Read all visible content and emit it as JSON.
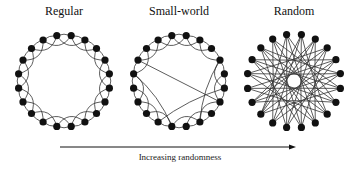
{
  "panels": [
    {
      "id": "regular",
      "title": "Regular",
      "cx": 64,
      "cy": 81,
      "r": 46,
      "nodes": 20,
      "rewired": []
    },
    {
      "id": "small-world",
      "title": "Small-world",
      "cx": 179,
      "cy": 81,
      "r": 46,
      "nodes": 20,
      "rewired": [
        [
          3,
          8
        ],
        [
          15,
          10
        ],
        [
          16,
          6
        ],
        [
          11,
          5
        ]
      ]
    },
    {
      "id": "random",
      "title": "Random",
      "cx": 294,
      "cy": 81,
      "r": 47,
      "nodes": 20,
      "random_edges": [
        [
          0,
          9
        ],
        [
          0,
          12
        ],
        [
          1,
          10
        ],
        [
          1,
          13
        ],
        [
          2,
          11
        ],
        [
          2,
          15
        ],
        [
          3,
          12
        ],
        [
          3,
          16
        ],
        [
          4,
          13
        ],
        [
          4,
          17
        ],
        [
          5,
          14
        ],
        [
          5,
          18
        ],
        [
          6,
          15
        ],
        [
          6,
          19
        ],
        [
          7,
          16
        ],
        [
          7,
          0
        ],
        [
          8,
          17
        ],
        [
          8,
          1
        ],
        [
          9,
          18
        ],
        [
          9,
          2
        ],
        [
          10,
          19
        ],
        [
          10,
          3
        ],
        [
          11,
          0
        ],
        [
          11,
          4
        ],
        [
          12,
          1
        ],
        [
          12,
          5
        ],
        [
          13,
          2
        ],
        [
          13,
          6
        ],
        [
          14,
          3
        ],
        [
          14,
          7
        ],
        [
          15,
          4
        ],
        [
          15,
          8
        ],
        [
          16,
          5
        ],
        [
          16,
          9
        ],
        [
          17,
          6
        ],
        [
          17,
          10
        ],
        [
          18,
          7
        ],
        [
          18,
          11
        ],
        [
          19,
          8
        ],
        [
          19,
          12
        ]
      ]
    }
  ],
  "axis": {
    "label": "Increasing randomness",
    "x1": 60,
    "x2": 296,
    "y": 147
  },
  "colors": {
    "ink": "#111111",
    "edge": "#333333"
  }
}
